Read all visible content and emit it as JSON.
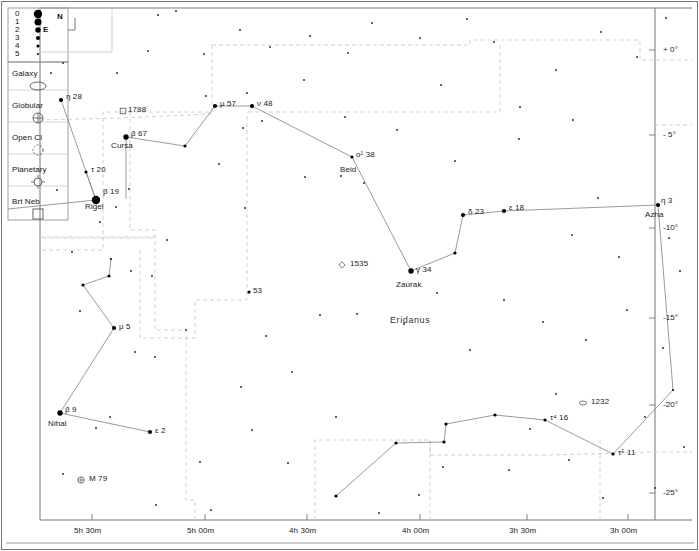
{
  "meta": {
    "header_remnant": "",
    "constellation_label": "Eridanus",
    "width": 699,
    "height": 551,
    "colors": {
      "background": "#ffffff",
      "frame": "#555555",
      "star": "#000000",
      "constellation_line": "#808080",
      "boundary_line": "#c9c9c9",
      "text": "#1a1a1a"
    }
  },
  "compass": {
    "north_label": "N",
    "east_label": "E"
  },
  "legend": {
    "magnitude_title": "",
    "magnitudes": [
      {
        "label": "0",
        "radius": 4.2
      },
      {
        "label": "1",
        "radius": 3.5
      },
      {
        "label": "2",
        "radius": 2.7
      },
      {
        "label": "3",
        "radius": 2.1
      },
      {
        "label": "4",
        "radius": 1.6
      },
      {
        "label": "5",
        "radius": 1.1
      }
    ],
    "objects": [
      {
        "label": "Galaxy",
        "icon": "galaxy-ellipse-icon"
      },
      {
        "label": "Globular",
        "icon": "globular-cluster-icon"
      },
      {
        "label": "Open Cl",
        "icon": "open-cluster-icon"
      },
      {
        "label": "Planetary",
        "icon": "planetary-nebula-icon"
      },
      {
        "label": "Brt Neb",
        "icon": "bright-nebula-icon"
      }
    ]
  },
  "axes": {
    "ra_label": "",
    "dec_label": "",
    "ra_ticks": [
      {
        "label": "5h 30m",
        "x": 92
      },
      {
        "label": "5h 00m",
        "x": 205
      },
      {
        "label": "4h 30m",
        "x": 307
      },
      {
        "label": "4h 00m",
        "x": 420
      },
      {
        "label": "3h 30m",
        "x": 527
      },
      {
        "label": "3h 00m",
        "x": 628
      }
    ],
    "dec_ticks": [
      {
        "label": "+ 0°",
        "y": 50
      },
      {
        "label": "- 5°",
        "y": 135
      },
      {
        "label": "-10°",
        "y": 228
      },
      {
        "label": "-15°",
        "y": 318
      },
      {
        "label": "-20°",
        "y": 405
      },
      {
        "label": "-25°",
        "y": 493
      }
    ]
  },
  "stars": [
    {
      "id": "eta28",
      "x": 61,
      "y": 100,
      "mag": 3,
      "label": "η  28",
      "lx": 66,
      "ly": 93,
      "name": null
    },
    {
      "id": "tau20",
      "x": 86,
      "y": 172,
      "mag": 4,
      "label": "τ  20",
      "lx": 91,
      "ly": 166,
      "name": null
    },
    {
      "id": "rigel",
      "x": 96,
      "y": 200,
      "mag": 0,
      "label": "β  19",
      "lx": 103,
      "ly": 188,
      "name": "Rigel",
      "nx": 85,
      "ny": 203
    },
    {
      "id": "beta67",
      "x": 126,
      "y": 137,
      "mag": 2,
      "label": "β  67",
      "lx": 131,
      "ly": 130,
      "name": "Cursa",
      "nx": 111,
      "ny": 142
    },
    {
      "id": "cursachain1",
      "x": 185,
      "y": 146,
      "mag": 4,
      "label": null
    },
    {
      "id": "mu57",
      "x": 215,
      "y": 106,
      "mag": 3,
      "label": "μ  57",
      "lx": 220,
      "ly": 100,
      "name": null
    },
    {
      "id": "nu48",
      "x": 252,
      "y": 106,
      "mag": 3,
      "label": "ν  48",
      "lx": 257,
      "ly": 100,
      "name": null
    },
    {
      "id": "beid",
      "x": 352,
      "y": 157,
      "mag": 4,
      "label": "ο¹ 38",
      "lx": 356,
      "ly": 151,
      "name": "Beid",
      "nx": 340,
      "ny": 166
    },
    {
      "id": "zaurak",
      "x": 411,
      "y": 271,
      "mag": 2,
      "label": "γ  34",
      "lx": 416,
      "ly": 266,
      "name": "Zaurak",
      "nx": 396,
      "ny": 281
    },
    {
      "id": "chain_a",
      "x": 455,
      "y": 253,
      "mag": 4,
      "label": null
    },
    {
      "id": "delta23",
      "x": 463,
      "y": 215,
      "mag": 3,
      "label": "δ  23",
      "lx": 468,
      "ly": 208,
      "name": null
    },
    {
      "id": "eps18",
      "x": 504,
      "y": 211,
      "mag": 3,
      "label": "ε  18",
      "lx": 509,
      "ly": 204,
      "name": null
    },
    {
      "id": "azha",
      "x": 658,
      "y": 205,
      "mag": 3,
      "label": "η  3",
      "lx": 661,
      "ly": 197,
      "name": "Azha",
      "nx": 645,
      "ny": 211
    },
    {
      "id": "mu5",
      "x": 114,
      "y": 328,
      "mag": 3,
      "label": "μ  5",
      "lx": 119,
      "ly": 323,
      "name": null
    },
    {
      "id": "lep_a",
      "x": 83,
      "y": 285,
      "mag": 4,
      "label": null
    },
    {
      "id": "lep_b",
      "x": 109,
      "y": 276,
      "mag": 4,
      "label": null
    },
    {
      "id": "lep_c",
      "x": 111,
      "y": 259,
      "mag": 5,
      "label": null
    },
    {
      "id": "nihal",
      "x": 60,
      "y": 413,
      "mag": 2,
      "label": "β  9",
      "lx": 65,
      "ly": 406,
      "name": "Nihal",
      "nx": 48,
      "ny": 420
    },
    {
      "id": "eps2",
      "x": 150,
      "y": 432,
      "mag": 3,
      "label": "ε  2",
      "lx": 155,
      "ly": 427,
      "name": null
    },
    {
      "id": "star53",
      "x": 249,
      "y": 292,
      "mag": 4,
      "label": "53",
      "lx": 253,
      "ly": 287,
      "name": null
    },
    {
      "id": "riv_a",
      "x": 336,
      "y": 496,
      "mag": 4,
      "label": null
    },
    {
      "id": "riv_b",
      "x": 396,
      "y": 443,
      "mag": 4,
      "label": null
    },
    {
      "id": "riv_c",
      "x": 444,
      "y": 442,
      "mag": 4,
      "label": null
    },
    {
      "id": "riv_d",
      "x": 446,
      "y": 424,
      "mag": 4,
      "label": null
    },
    {
      "id": "riv_e",
      "x": 495,
      "y": 415,
      "mag": 4,
      "label": null
    },
    {
      "id": "tau4_16",
      "x": 545,
      "y": 420,
      "mag": 4,
      "label": "τ⁴ 16",
      "lx": 550,
      "ly": 414,
      "name": null
    },
    {
      "id": "tau5_11",
      "x": 613,
      "y": 454,
      "mag": 4,
      "label": "τ⁵ 11",
      "lx": 618,
      "ly": 449,
      "name": null
    },
    {
      "id": "riv_f",
      "x": 673,
      "y": 390,
      "mag": 5,
      "label": null
    }
  ],
  "faint_stars": [
    {
      "x": 63,
      "y": 63,
      "mag": 5
    },
    {
      "x": 51,
      "y": 73,
      "mag": 5
    },
    {
      "x": 158,
      "y": 15,
      "mag": 5
    },
    {
      "x": 176,
      "y": 11,
      "mag": 5
    },
    {
      "x": 240,
      "y": 30,
      "mag": 5
    },
    {
      "x": 270,
      "y": 47,
      "mag": 5
    },
    {
      "x": 310,
      "y": 36,
      "mag": 5
    },
    {
      "x": 348,
      "y": 53,
      "mag": 5
    },
    {
      "x": 372,
      "y": 23,
      "mag": 5
    },
    {
      "x": 420,
      "y": 38,
      "mag": 5
    },
    {
      "x": 467,
      "y": 19,
      "mag": 5
    },
    {
      "x": 494,
      "y": 42,
      "mag": 5
    },
    {
      "x": 520,
      "y": 107,
      "mag": 5
    },
    {
      "x": 556,
      "y": 70,
      "mag": 5
    },
    {
      "x": 601,
      "y": 32,
      "mag": 5
    },
    {
      "x": 637,
      "y": 57,
      "mag": 5
    },
    {
      "x": 666,
      "y": 18,
      "mag": 5
    },
    {
      "x": 117,
      "y": 73,
      "mag": 5
    },
    {
      "x": 148,
      "y": 51,
      "mag": 5
    },
    {
      "x": 204,
      "y": 54,
      "mag": 5
    },
    {
      "x": 243,
      "y": 128,
      "mag": 5
    },
    {
      "x": 245,
      "y": 208,
      "mag": 5
    },
    {
      "x": 206,
      "y": 96,
      "mag": 5
    },
    {
      "x": 247,
      "y": 93,
      "mag": 5
    },
    {
      "x": 304,
      "y": 80,
      "mag": 5
    },
    {
      "x": 345,
      "y": 117,
      "mag": 5
    },
    {
      "x": 305,
      "y": 177,
      "mag": 5
    },
    {
      "x": 262,
      "y": 121,
      "mag": 5
    },
    {
      "x": 341,
      "y": 176,
      "mag": 5
    },
    {
      "x": 364,
      "y": 183,
      "mag": 5
    },
    {
      "x": 397,
      "y": 130,
      "mag": 5
    },
    {
      "x": 441,
      "y": 85,
      "mag": 5
    },
    {
      "x": 455,
      "y": 161,
      "mag": 5
    },
    {
      "x": 519,
      "y": 139,
      "mag": 5
    },
    {
      "x": 573,
      "y": 120,
      "mag": 5
    },
    {
      "x": 598,
      "y": 198,
      "mag": 5
    },
    {
      "x": 572,
      "y": 235,
      "mag": 5
    },
    {
      "x": 619,
      "y": 257,
      "mag": 5
    },
    {
      "x": 669,
      "y": 238,
      "mag": 5
    },
    {
      "x": 680,
      "y": 271,
      "mag": 5
    },
    {
      "x": 116,
      "y": 207,
      "mag": 5
    },
    {
      "x": 100,
      "y": 222,
      "mag": 5
    },
    {
      "x": 57,
      "y": 190,
      "mag": 5
    },
    {
      "x": 72,
      "y": 252,
      "mag": 5
    },
    {
      "x": 131,
      "y": 271,
      "mag": 5
    },
    {
      "x": 167,
      "y": 240,
      "mag": 5
    },
    {
      "x": 80,
      "y": 311,
      "mag": 5
    },
    {
      "x": 152,
      "y": 276,
      "mag": 5
    },
    {
      "x": 186,
      "y": 330,
      "mag": 5
    },
    {
      "x": 155,
      "y": 357,
      "mag": 5
    },
    {
      "x": 241,
      "y": 387,
      "mag": 5
    },
    {
      "x": 266,
      "y": 336,
      "mag": 5
    },
    {
      "x": 292,
      "y": 372,
      "mag": 5
    },
    {
      "x": 320,
      "y": 315,
      "mag": 5
    },
    {
      "x": 357,
      "y": 314,
      "mag": 5
    },
    {
      "x": 404,
      "y": 324,
      "mag": 5
    },
    {
      "x": 437,
      "y": 293,
      "mag": 5
    },
    {
      "x": 470,
      "y": 350,
      "mag": 5
    },
    {
      "x": 504,
      "y": 300,
      "mag": 5
    },
    {
      "x": 543,
      "y": 322,
      "mag": 5
    },
    {
      "x": 586,
      "y": 340,
      "mag": 5
    },
    {
      "x": 627,
      "y": 310,
      "mag": 5
    },
    {
      "x": 663,
      "y": 348,
      "mag": 5
    },
    {
      "x": 110,
      "y": 417,
      "mag": 5
    },
    {
      "x": 96,
      "y": 428,
      "mag": 5
    },
    {
      "x": 63,
      "y": 474,
      "mag": 5
    },
    {
      "x": 156,
      "y": 505,
      "mag": 5
    },
    {
      "x": 200,
      "y": 462,
      "mag": 5
    },
    {
      "x": 211,
      "y": 510,
      "mag": 5
    },
    {
      "x": 288,
      "y": 463,
      "mag": 5
    },
    {
      "x": 252,
      "y": 430,
      "mag": 5
    },
    {
      "x": 336,
      "y": 417,
      "mag": 5
    },
    {
      "x": 443,
      "y": 467,
      "mag": 5
    },
    {
      "x": 419,
      "y": 495,
      "mag": 5
    },
    {
      "x": 379,
      "y": 513,
      "mag": 5
    },
    {
      "x": 509,
      "y": 470,
      "mag": 5
    },
    {
      "x": 530,
      "y": 429,
      "mag": 5
    },
    {
      "x": 556,
      "y": 394,
      "mag": 5
    },
    {
      "x": 569,
      "y": 460,
      "mag": 5
    },
    {
      "x": 645,
      "y": 417,
      "mag": 5
    },
    {
      "x": 603,
      "y": 498,
      "mag": 5
    },
    {
      "x": 655,
      "y": 488,
      "mag": 5
    },
    {
      "x": 684,
      "y": 447,
      "mag": 5
    },
    {
      "x": 135,
      "y": 352,
      "mag": 5
    },
    {
      "x": 219,
      "y": 164,
      "mag": 5
    },
    {
      "x": 129,
      "y": 189,
      "mag": 5
    }
  ],
  "deep_sky": [
    {
      "id": "ngc1788",
      "type": "bright-nebula",
      "x": 123,
      "y": 111,
      "label": "1788",
      "lx": 128,
      "ly": 106
    },
    {
      "id": "ngc1535",
      "type": "planetary",
      "x": 342,
      "y": 265,
      "label": "1535",
      "lx": 350,
      "ly": 260
    },
    {
      "id": "ngc1232",
      "type": "galaxy",
      "x": 583,
      "y": 403,
      "label": "1232",
      "lx": 591,
      "ly": 398
    },
    {
      "id": "m79",
      "type": "globular",
      "x": 81,
      "y": 480,
      "label": "M 79",
      "lx": 89,
      "ly": 475
    }
  ],
  "constellation_lines": [
    [
      "eta28",
      "rigel"
    ],
    [
      "tau20",
      "rigel"
    ],
    [
      "rigel",
      "edge_left_200"
    ],
    [
      "beta67",
      "cursachain1"
    ],
    [
      "cursachain1",
      "mu57"
    ],
    [
      "mu57",
      "nu48"
    ],
    [
      "nu48",
      "beid"
    ],
    [
      "beid",
      "zaurak"
    ],
    [
      "zaurak",
      "chain_a"
    ],
    [
      "chain_a",
      "delta23"
    ],
    [
      "delta23",
      "eps18"
    ],
    [
      "eps18",
      "azha"
    ],
    [
      "azha",
      "riv_f"
    ],
    [
      "riv_f",
      "tau5_11"
    ],
    [
      "tau5_11",
      "tau4_16"
    ],
    [
      "tau4_16",
      "riv_e"
    ],
    [
      "riv_e",
      "riv_d"
    ],
    [
      "riv_d",
      "riv_c"
    ],
    [
      "riv_c",
      "riv_b"
    ],
    [
      "riv_b",
      "riv_a"
    ],
    [
      "lep_c",
      "lep_b"
    ],
    [
      "lep_b",
      "lep_a"
    ],
    [
      "lep_a",
      "mu5"
    ],
    [
      "mu5",
      "nihal"
    ],
    [
      "nihal",
      "eps2"
    ],
    [
      "beta67",
      "down_stub"
    ]
  ]
}
